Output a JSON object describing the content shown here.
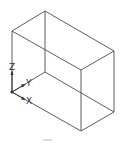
{
  "diagram": {
    "title": "",
    "shape": "rectangular box (wireframe, isometric view)",
    "ucs_icon": {
      "axes": [
        {
          "name": "X",
          "label": "X"
        },
        {
          "name": "Y",
          "label": "Y"
        },
        {
          "name": "Z",
          "label": "Z"
        }
      ]
    },
    "colors": {
      "edge": "#4a4a4a",
      "background": "#ffffff"
    }
  }
}
